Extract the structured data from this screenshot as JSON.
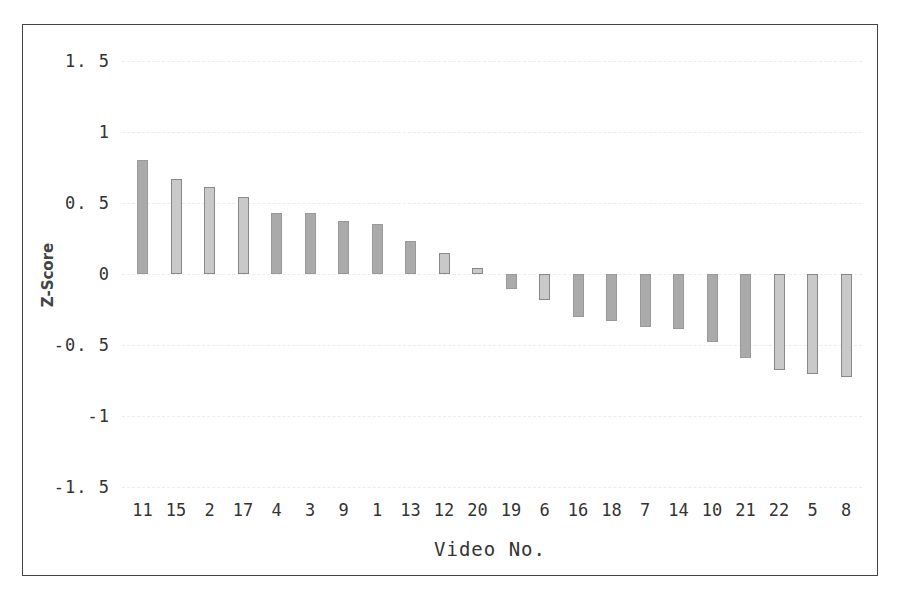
{
  "chart_data": {
    "type": "bar",
    "title": "",
    "xlabel": "Video No.",
    "ylabel": "Z-Score",
    "ylim": [
      -1.5,
      1.5
    ],
    "yticks": [
      "1.5",
      "1",
      "0.5",
      "0",
      "-0.5",
      "-1",
      "-1.5"
    ],
    "grid": true,
    "legend": null,
    "categories": [
      "11",
      "15",
      "2",
      "17",
      "4",
      "3",
      "9",
      "1",
      "13",
      "12",
      "20",
      "19",
      "6",
      "16",
      "18",
      "7",
      "14",
      "10",
      "21",
      "22",
      "5",
      "8"
    ],
    "values": [
      0.8,
      0.67,
      0.61,
      0.54,
      0.43,
      0.43,
      0.375,
      0.35,
      0.235,
      0.15,
      0.04,
      -0.105,
      -0.18,
      -0.305,
      -0.33,
      -0.375,
      -0.39,
      -0.48,
      -0.59,
      -0.675,
      -0.705,
      -0.725
    ]
  },
  "colors": {
    "bar": "#aaaaaa",
    "bar_light": "#c9c9c9",
    "border": "#444444",
    "grid": "#ececec"
  }
}
